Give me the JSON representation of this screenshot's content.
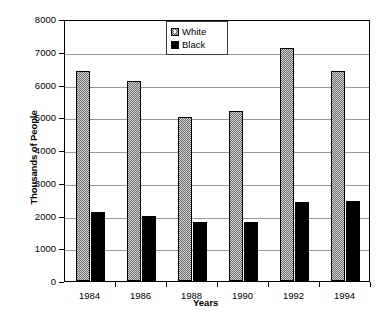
{
  "chart_data": {
    "type": "bar",
    "title": "",
    "xlabel": "Years",
    "ylabel": "Thousands of People",
    "categories": [
      "1984",
      "1986",
      "1988",
      "1990",
      "1992",
      "1994"
    ],
    "series": [
      {
        "name": "White",
        "values": [
          6400,
          6100,
          5000,
          5200,
          7100,
          6400
        ],
        "color": "#d2d2d2",
        "fill": "checkered-gray"
      },
      {
        "name": "Black",
        "values": [
          2100,
          2000,
          1800,
          1800,
          2400,
          2450
        ],
        "color": "#000000",
        "fill": "solid-black"
      }
    ],
    "ylim": [
      0,
      8000
    ],
    "y_ticks": [
      0,
      1000,
      2000,
      3000,
      4000,
      5000,
      6000,
      7000,
      8000
    ],
    "y_tick_labels": [
      "0",
      "1000",
      "2000",
      "3000",
      "4000",
      "5000",
      "6000",
      "7000",
      "8000"
    ],
    "grid": true,
    "legend_position": "top-center",
    "legend_entries": [
      "White",
      "Black"
    ]
  },
  "axes": {
    "y_title": "Thousands of People",
    "x_title": "Years"
  },
  "legend": {
    "items": [
      {
        "label": "White",
        "swatch": "checkered-swatch-icon"
      },
      {
        "label": "Black",
        "swatch": "solid-black-swatch-icon"
      }
    ]
  }
}
